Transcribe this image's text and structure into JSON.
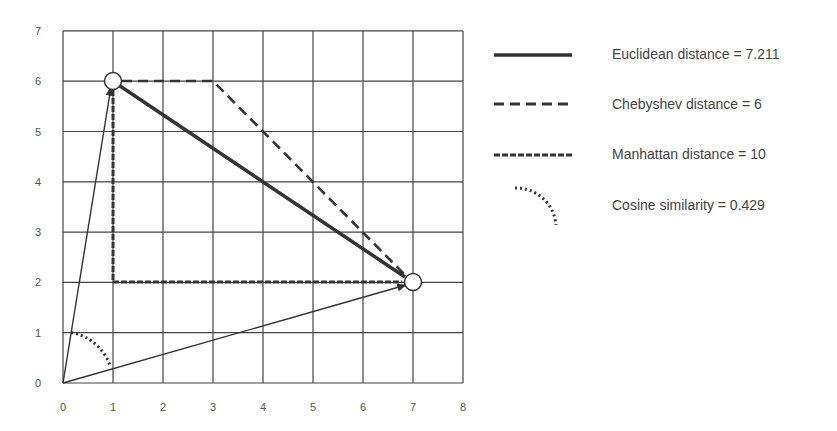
{
  "chart_data": {
    "type": "line",
    "title": "",
    "xlabel": "",
    "ylabel": "",
    "xlim": [
      0,
      8
    ],
    "ylim": [
      0,
      7
    ],
    "grid": true,
    "legend_position": "right",
    "x_ticks": [
      "0",
      "1",
      "2",
      "3",
      "4",
      "5",
      "6",
      "7",
      "8"
    ],
    "y_ticks": [
      "0",
      "1",
      "2",
      "3",
      "4",
      "5",
      "6",
      "7"
    ],
    "points": [
      {
        "name": "A",
        "x": 1,
        "y": 6
      },
      {
        "name": "B",
        "x": 7,
        "y": 2
      }
    ],
    "series": [
      {
        "name": "Euclidean distance = 7.211",
        "style": "solid-thick",
        "x": [
          1,
          7
        ],
        "y": [
          6,
          2
        ]
      },
      {
        "name": "Chebyshev distance = 6",
        "style": "dashed",
        "x": [
          1,
          3,
          7
        ],
        "y": [
          6,
          6,
          2
        ]
      },
      {
        "name": "Manhattan distance = 10",
        "style": "short-dashed",
        "x": [
          1,
          1,
          7
        ],
        "y": [
          6,
          2,
          2
        ]
      },
      {
        "name": "Cosine similarity = 0.429",
        "style": "dotted-arc",
        "center": [
          0,
          0
        ],
        "radius": 1
      }
    ],
    "vectors": [
      {
        "from": [
          0,
          0
        ],
        "to": [
          1,
          6
        ]
      },
      {
        "from": [
          0,
          0
        ],
        "to": [
          7,
          2
        ]
      }
    ]
  },
  "legend": {
    "items": [
      {
        "label": "Euclidean distance = 7.211"
      },
      {
        "label": "Chebyshev distance = 6"
      },
      {
        "label": "Manhattan distance = 10"
      },
      {
        "label": "Cosine similarity = 0.429"
      }
    ]
  },
  "colors": {
    "line": "#333333",
    "grid": "#444444",
    "text": "#555555"
  }
}
